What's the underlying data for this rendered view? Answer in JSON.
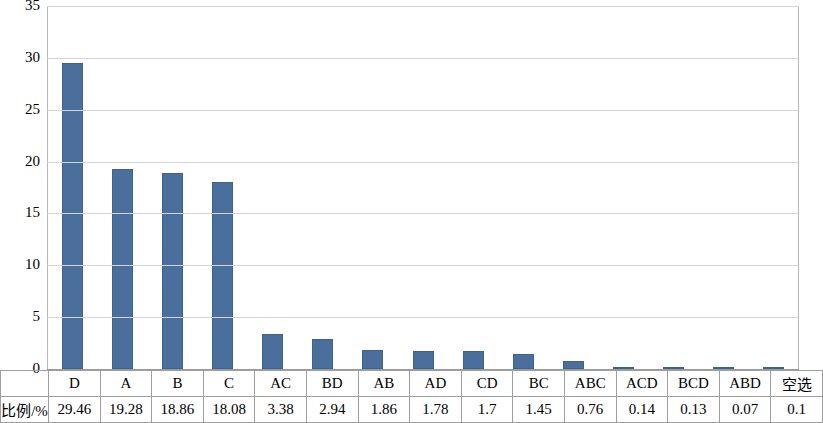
{
  "chart_data": {
    "type": "bar",
    "title": "",
    "xlabel": "",
    "ylabel": "",
    "ylim": [
      0,
      35
    ],
    "yticks": [
      0,
      5,
      10,
      15,
      20,
      25,
      30,
      35
    ],
    "grid": true,
    "legend": "none",
    "categories": [
      "D",
      "A",
      "B",
      "C",
      "AC",
      "BD",
      "AB",
      "AD",
      "CD",
      "BC",
      "ABC",
      "ACD",
      "BCD",
      "ABD",
      "空选"
    ],
    "values": [
      29.46,
      19.28,
      18.86,
      18.08,
      3.38,
      2.94,
      1.86,
      1.78,
      1.7,
      1.45,
      0.76,
      0.14,
      0.13,
      0.07,
      0.1
    ],
    "bar_color": "#4a6f9c"
  },
  "table": {
    "row_label": "比例/%",
    "headers": [
      "D",
      "A",
      "B",
      "C",
      "AC",
      "BD",
      "AB",
      "AD",
      "CD",
      "BC",
      "ABC",
      "ACD",
      "BCD",
      "ABD",
      "空选"
    ],
    "values": [
      "29.46",
      "19.28",
      "18.86",
      "18.08",
      "3.38",
      "2.94",
      "1.86",
      "1.78",
      "1.7",
      "1.45",
      "0.76",
      "0.14",
      "0.13",
      "0.07",
      "0.1"
    ]
  }
}
